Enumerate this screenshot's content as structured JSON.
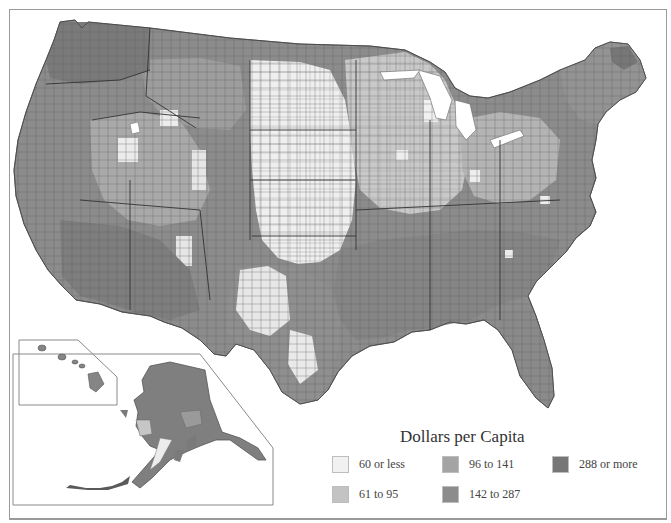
{
  "map": {
    "type": "choropleth",
    "region": "United States (counties), with Alaska and Hawaii inset",
    "palette": [
      "#f1f1f1",
      "#c3c3c3",
      "#a4a4a4",
      "#8c8c8c",
      "#767676"
    ]
  },
  "legend": {
    "title": "Dollars per Capita",
    "items": [
      {
        "label": "60 or less",
        "color": "#f1f1f1"
      },
      {
        "label": "61 to 95",
        "color": "#c3c3c3"
      },
      {
        "label": "96 to 141",
        "color": "#a4a4a4"
      },
      {
        "label": "142 to 287",
        "color": "#8c8c8c"
      },
      {
        "label": "288 or more",
        "color": "#767676"
      }
    ]
  }
}
